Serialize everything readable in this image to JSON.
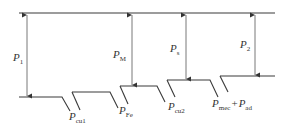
{
  "diagram": {
    "type": "power-flow",
    "colors": {
      "line": "#3a3a3a",
      "background": "#ffffff"
    },
    "labels": {
      "p1": {
        "main": "P",
        "sub": "1"
      },
      "pm": {
        "main": "P",
        "sub": "M"
      },
      "ps": {
        "main": "P",
        "sub": "s"
      },
      "p2": {
        "main": "P",
        "sub": "2"
      },
      "pcu1": {
        "main": "P",
        "sub": "cu1"
      },
      "pfe": {
        "main": "P",
        "sub": "Fe"
      },
      "pcu2": {
        "main": "P",
        "sub": "cu2"
      },
      "pmec": {
        "main": "P",
        "sub": "mec"
      },
      "plus": "+",
      "pad": {
        "main": "P",
        "sub": "ad"
      }
    }
  }
}
